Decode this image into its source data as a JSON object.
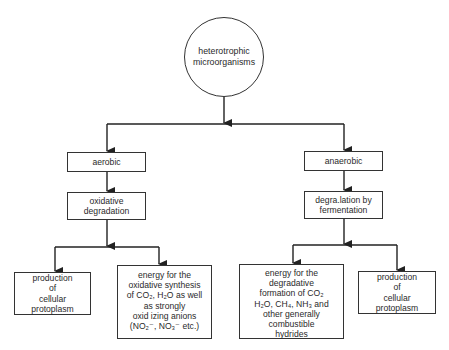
{
  "diagram": {
    "root": {
      "label": "heterotrophic\nmicroorganisms"
    },
    "branches": [
      {
        "id": "aerobic",
        "label": "aerobic",
        "process": "oxidative\ndegradation",
        "outcomes": [
          {
            "id": "aerobic-production",
            "lines": [
              "production",
              "of",
              "cellular",
              "protoplasm"
            ]
          },
          {
            "id": "aerobic-energy",
            "lines": [
              "energy for the",
              "oxidative synthesis",
              "of CO₂, H₂O as well",
              "as strongly",
              "oxid izing anions",
              "(NO₂⁻, NO₃⁻ etc.)"
            ]
          }
        ]
      },
      {
        "id": "anaerobic",
        "label": "anaerobic",
        "process": "degra.lation by\nfermentation",
        "outcomes": [
          {
            "id": "anaerobic-energy",
            "lines": [
              "energy for the",
              "degradative",
              "formation of CO₂",
              "H₂O, CH₄, NH₃ and",
              "other generally",
              "combustible",
              "hydrides"
            ]
          },
          {
            "id": "anaerobic-production",
            "lines": [
              "production",
              "of",
              "cellular",
              "protoplasm"
            ]
          }
        ]
      }
    ],
    "colors": {
      "line": "#333333",
      "text": "#2a2a2a",
      "background": "#ffffff"
    }
  }
}
